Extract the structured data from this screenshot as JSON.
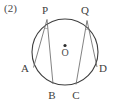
{
  "figure": {
    "problem_number": "(2)",
    "caption_text": "(2)",
    "shape": "circle-with-inscribed-angles",
    "stroke_colors": {
      "circle": "#3f3f3f",
      "chord": "#6b6b6b",
      "angle_arc": "#8a8a8a",
      "label": "#3d3d3d",
      "center_dot": "#2b2b2b",
      "background": "#ffffff"
    },
    "circle": {
      "center_x": 65,
      "center_y": 52,
      "radius": 33,
      "center_label": "O"
    },
    "points": [
      {
        "id": "P",
        "label": "P",
        "x": 47,
        "y": 19.5,
        "label_x": 45,
        "label_y": 14
      },
      {
        "id": "Q",
        "label": "Q",
        "x": 87,
        "y": 20.5,
        "label_x": 85,
        "label_y": 14
      },
      {
        "id": "A",
        "label": "A",
        "x": 33.5,
        "y": 67.5,
        "label_x": 25,
        "label_y": 72
      },
      {
        "id": "B",
        "label": "B",
        "x": 53,
        "y": 84,
        "label_x": 50,
        "label_y": 98
      },
      {
        "id": "C",
        "label": "C",
        "x": 76,
        "y": 84.5,
        "label_x": 73,
        "label_y": 98
      },
      {
        "id": "D",
        "label": "D",
        "x": 97,
        "y": 67,
        "label_x": 99,
        "label_y": 72
      }
    ],
    "chords": [
      {
        "id": "PA",
        "from": "P",
        "to": "A"
      },
      {
        "id": "PB",
        "from": "P",
        "to": "B"
      },
      {
        "id": "QC",
        "from": "Q",
        "to": "C"
      },
      {
        "id": "QD",
        "from": "Q",
        "to": "D"
      }
    ],
    "angle_marks": [
      {
        "id": "angle-at-P",
        "vertex": "P"
      },
      {
        "id": "angle-at-Q",
        "vertex": "Q"
      }
    ]
  }
}
